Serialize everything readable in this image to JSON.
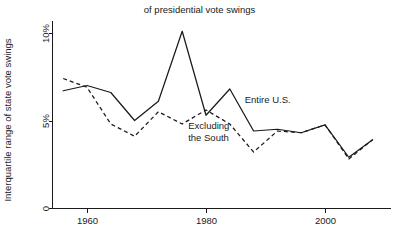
{
  "chart_data": {
    "type": "line",
    "title": "of presidential vote swings",
    "xlabel": "",
    "ylabel": "Interquartile range of state vote swings",
    "xlim": [
      1955,
      2009
    ],
    "ylim": [
      0,
      10.6
    ],
    "grid": false,
    "legend_position": "inline-annotations",
    "x_ticks": [
      1960,
      1980,
      2000
    ],
    "x_tick_labels": [
      "1960",
      "1980",
      "2000"
    ],
    "y_ticks": [
      0,
      5,
      10
    ],
    "y_tick_labels": [
      "0",
      "5%",
      "10%"
    ],
    "x": [
      1956,
      1960,
      1964,
      1968,
      1972,
      1976,
      1980,
      1984,
      1988,
      1992,
      1996,
      2000,
      2004,
      2008
    ],
    "series": [
      {
        "name": "Entire U.S.",
        "style": "solid",
        "values": [
          6.7,
          7.0,
          6.6,
          5.0,
          6.1,
          10.1,
          5.3,
          6.8,
          4.4,
          4.5,
          4.3,
          4.75,
          2.9,
          3.9
        ]
      },
      {
        "name": "Excluding the South",
        "style": "dashed",
        "values": [
          7.4,
          6.9,
          4.8,
          4.1,
          5.5,
          4.8,
          5.6,
          4.8,
          3.2,
          4.4,
          4.3,
          4.75,
          2.8,
          3.9
        ]
      }
    ],
    "annotations": [
      {
        "text": "Entire U.S.",
        "x": 1986.5,
        "y": 6.0,
        "lines": 1
      },
      {
        "text": "Excluding",
        "x": 1977.0,
        "y": 4.5,
        "lines": 1
      },
      {
        "text": "the South",
        "x": 1977.0,
        "y": 3.85,
        "lines": 1
      }
    ],
    "colors": {
      "axis": "#1a1a1a",
      "series_entire_us": "#1a1a1a",
      "series_excluding_south": "#1a1a1a",
      "background": "#ffffff"
    }
  },
  "annotation_labels": {
    "entire_us": "Entire U.S.",
    "excluding_line1": "Excluding",
    "excluding_line2": "the South"
  }
}
